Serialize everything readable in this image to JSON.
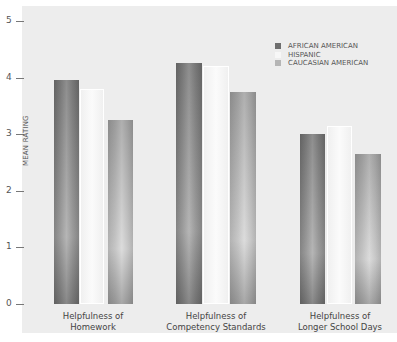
{
  "chart_data": {
    "type": "bar",
    "title": "",
    "xlabel": "",
    "ylabel": "MEAN RATING",
    "ylim": [
      0,
      5
    ],
    "yticks": [
      "0",
      "1",
      "2",
      "3",
      "4",
      "5"
    ],
    "grid": false,
    "legend_position": "top-right",
    "categories": [
      "Helpfulness of Homework",
      "Helpfulness of Competency Standards",
      "Helpfulness of Longer School Days"
    ],
    "category_lines": [
      [
        "Helpfulness of",
        "Homework"
      ],
      [
        "Helpfulness of",
        "Competency Standards"
      ],
      [
        "Helpfulness of",
        "Longer School Days"
      ]
    ],
    "series": [
      {
        "name": "AFRICAN AMERICAN",
        "color": "#7a7a7a",
        "values": [
          3.95,
          4.25,
          3.0
        ]
      },
      {
        "name": "HISPANIC",
        "color": "#f7f7f7",
        "values": [
          3.8,
          4.2,
          3.15
        ]
      },
      {
        "name": "CAUCASIAN AMERICAN",
        "color": "#b8b8b8",
        "values": [
          3.25,
          3.75,
          2.65
        ]
      }
    ]
  }
}
